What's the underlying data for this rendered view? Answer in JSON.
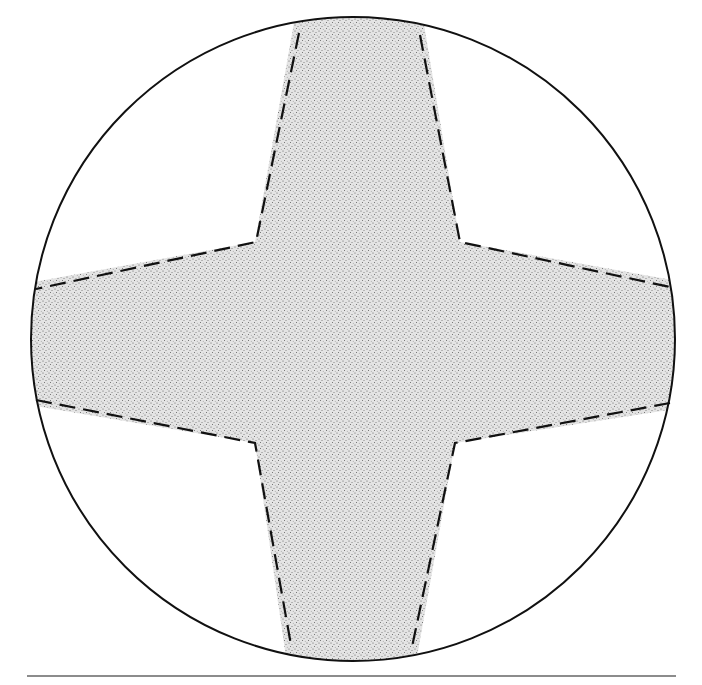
{
  "figure": {
    "colors": {
      "background": "#ffffff",
      "outline": "#111111",
      "stipple_fill": "#d9d9d9",
      "stipple_dot": "#555555",
      "baseline": "#666666"
    },
    "circle": {
      "cx": 353,
      "cy": 339,
      "r": 322
    },
    "labels": []
  }
}
